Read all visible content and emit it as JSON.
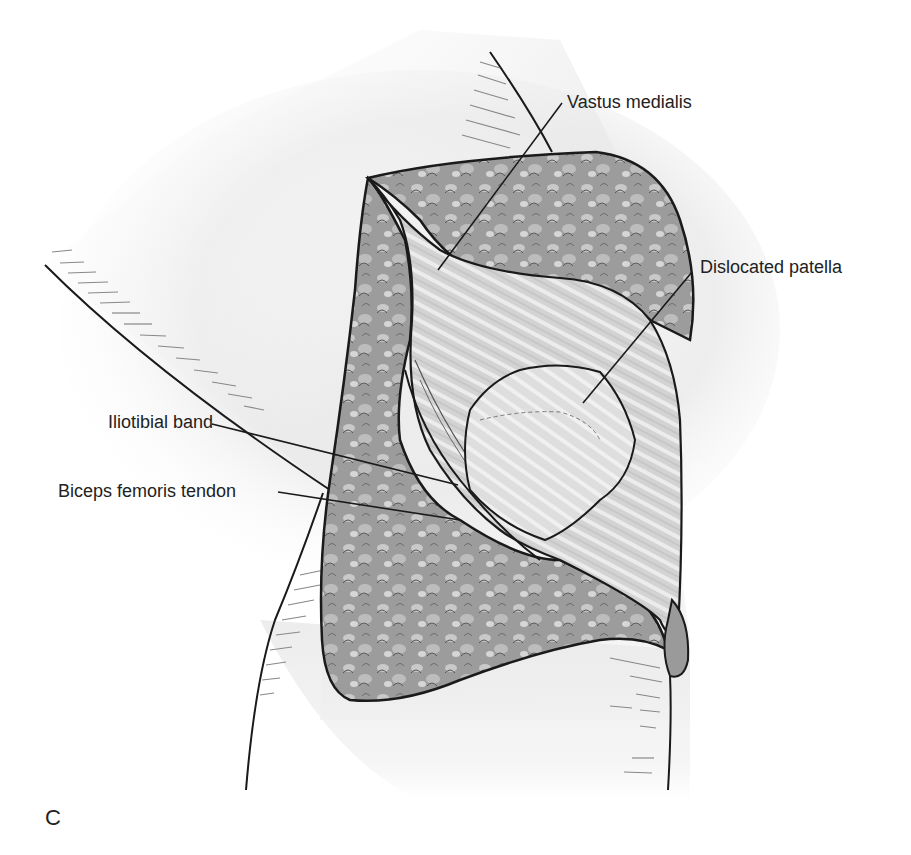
{
  "figure": {
    "panel_letter": "C",
    "labels": [
      {
        "id": "vastus-medialis",
        "text": "Vastus medialis"
      },
      {
        "id": "dislocated-patella",
        "text": "Dislocated patella"
      },
      {
        "id": "iliotibial-band",
        "text": "Iliotibial band"
      },
      {
        "id": "biceps-femoris-tendon",
        "text": "Biceps femoris tendon"
      }
    ],
    "colors": {
      "background": "#ffffff",
      "outline": "#1a1a1a",
      "skin_shade": "#e6e6e6",
      "fat_tissue": "#9a9a9a",
      "fat_highlight": "#d8d8d8",
      "muscle": "#cfcfcf",
      "patella": "#dcdcdc",
      "text": "#222222"
    }
  }
}
